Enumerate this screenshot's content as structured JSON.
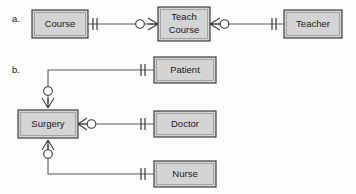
{
  "diagram": {
    "type": "entity-relationship-crows-foot",
    "background_color": "#fdfdfd",
    "entity_fill_color": "#d4d4d4",
    "entity_stroke_color": "#3c3c3c",
    "line_color": "#5a5a5a",
    "sections": [
      {
        "id": "a",
        "label": "a.",
        "entities": [
          {
            "id": "course",
            "label": "Course"
          },
          {
            "id": "teach-course",
            "label": "Teach\nCourse",
            "line1": "Teach",
            "line2": "Course"
          },
          {
            "id": "teacher",
            "label": "Teacher"
          }
        ],
        "relationships": [
          {
            "id": "course-teachcourse",
            "from": "course",
            "to": "teach-course",
            "from_cardinality": "one-and-only-one",
            "from_symbol": "double-tick",
            "to_cardinality": "zero-or-many",
            "to_symbol": "circle-crowsfoot"
          },
          {
            "id": "teachcourse-teacher",
            "from": "teach-course",
            "to": "teacher",
            "from_cardinality": "zero-or-many",
            "from_symbol": "crowsfoot-circle",
            "to_cardinality": "one-and-only-one",
            "to_symbol": "double-tick"
          }
        ]
      },
      {
        "id": "b",
        "label": "b.",
        "entities": [
          {
            "id": "surgery",
            "label": "Surgery"
          },
          {
            "id": "patient",
            "label": "Patient"
          },
          {
            "id": "doctor",
            "label": "Doctor"
          },
          {
            "id": "nurse",
            "label": "Nurse"
          }
        ],
        "relationships": [
          {
            "id": "surgery-patient",
            "from": "surgery",
            "to": "patient",
            "from_cardinality": "zero-or-many",
            "from_symbol": "circle-crowsfoot",
            "to_cardinality": "one-and-only-one",
            "to_symbol": "double-tick"
          },
          {
            "id": "surgery-doctor",
            "from": "surgery",
            "to": "doctor",
            "from_cardinality": "zero-or-many",
            "from_symbol": "crowsfoot-circle",
            "to_cardinality": "one-and-only-one",
            "to_symbol": "double-tick"
          },
          {
            "id": "surgery-nurse",
            "from": "surgery",
            "to": "nurse",
            "from_cardinality": "zero-or-many",
            "from_symbol": "crowsfoot-circle",
            "to_cardinality": "one-and-only-one",
            "to_symbol": "double-tick"
          }
        ]
      }
    ]
  }
}
